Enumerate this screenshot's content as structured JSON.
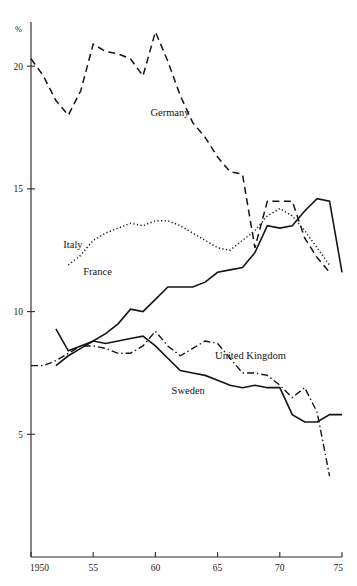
{
  "chart_data": {
    "type": "line",
    "title": "",
    "xlabel": "",
    "ylabel": "%",
    "xlim": [
      1950,
      1975
    ],
    "ylim": [
      0,
      21.8
    ],
    "grid": false,
    "legend_position": "inline-labels",
    "x_ticks": [
      {
        "value": 1950,
        "label": "1950"
      },
      {
        "value": 1955,
        "label": "55"
      },
      {
        "value": 1960,
        "label": "60"
      },
      {
        "value": 1965,
        "label": "65"
      },
      {
        "value": 1970,
        "label": "70"
      },
      {
        "value": 1975,
        "label": "75"
      }
    ],
    "y_ticks": [
      {
        "value": 5,
        "label": "5"
      },
      {
        "value": 10,
        "label": "10"
      },
      {
        "value": 15,
        "label": "15"
      },
      {
        "value": 20,
        "label": "20"
      }
    ],
    "series": [
      {
        "name": "Germany",
        "label": "Germany",
        "style": "dashed",
        "dash": "7,4.5",
        "width": 1.5,
        "label_x": 1959.6,
        "label_y": 17.95,
        "x": [
          1950,
          1951,
          1952,
          1953,
          1954,
          1955,
          1956,
          1957,
          1958,
          1959,
          1960,
          1961,
          1962,
          1963,
          1964,
          1965,
          1966,
          1967,
          1968,
          1969,
          1970,
          1971,
          1972,
          1973,
          1974
        ],
        "values": [
          20.3,
          19.6,
          18.6,
          18.0,
          19.0,
          20.9,
          20.6,
          20.5,
          20.3,
          19.6,
          21.4,
          20.2,
          18.8,
          17.7,
          17.1,
          16.3,
          15.7,
          15.6,
          12.6,
          14.5,
          14.5,
          14.5,
          13.0,
          12.2,
          11.6
        ]
      },
      {
        "name": "Italy",
        "label": "Italy",
        "style": "dotted",
        "dash": "1.2,2.4",
        "width": 1.5,
        "label_x": 1952.6,
        "label_y": 12.6,
        "x": [
          1953,
          1954,
          1955,
          1956,
          1957,
          1958,
          1959,
          1960,
          1961,
          1962,
          1963,
          1964,
          1965,
          1966,
          1967,
          1968,
          1969,
          1970,
          1971,
          1972,
          1973,
          1974
        ],
        "values": [
          11.9,
          12.3,
          12.9,
          13.2,
          13.4,
          13.6,
          13.5,
          13.7,
          13.7,
          13.5,
          13.2,
          12.9,
          12.6,
          12.5,
          12.9,
          13.3,
          13.9,
          14.2,
          13.9,
          13.3,
          12.6,
          11.9
        ]
      },
      {
        "name": "France",
        "label": "France",
        "style": "solid",
        "dash": "",
        "width": 1.6,
        "label_x": 1954.2,
        "label_y": 11.5,
        "x": [
          1952,
          1953,
          1954,
          1955,
          1956,
          1957,
          1958,
          1959,
          1960,
          1961,
          1962,
          1963,
          1964,
          1965,
          1966,
          1967,
          1968,
          1969,
          1970,
          1971,
          1972,
          1973,
          1974,
          1975
        ],
        "values": [
          7.8,
          8.2,
          8.5,
          8.8,
          9.1,
          9.5,
          10.1,
          10.0,
          10.5,
          11.0,
          11.0,
          11.0,
          11.2,
          11.6,
          11.7,
          11.8,
          12.4,
          13.5,
          13.4,
          13.5,
          14.1,
          14.6,
          14.5,
          11.6
        ]
      },
      {
        "name": "United Kingdom",
        "label": "United Kingdom",
        "style": "dash-dot",
        "dash": "7,3,1.4,3",
        "width": 1.4,
        "label_x": 1964.8,
        "label_y": 8.05,
        "x": [
          1950,
          1951,
          1952,
          1953,
          1954,
          1955,
          1956,
          1957,
          1958,
          1959,
          1960,
          1961,
          1962,
          1963,
          1964,
          1965,
          1966,
          1967,
          1968,
          1969,
          1970,
          1971,
          1972,
          1973,
          1974
        ],
        "values": [
          7.8,
          7.8,
          8.0,
          8.3,
          8.6,
          8.6,
          8.5,
          8.3,
          8.3,
          8.6,
          9.2,
          8.6,
          8.2,
          8.5,
          8.8,
          8.7,
          8.1,
          7.5,
          7.5,
          7.4,
          7.0,
          6.5,
          6.9,
          5.9,
          3.3
        ]
      },
      {
        "name": "Sweden",
        "label": "Sweden",
        "style": "solid",
        "dash": "",
        "width": 1.6,
        "label_x": 1961.3,
        "label_y": 6.65,
        "x": [
          1952,
          1953,
          1954,
          1955,
          1956,
          1957,
          1958,
          1959,
          1960,
          1961,
          1962,
          1963,
          1964,
          1965,
          1966,
          1967,
          1968,
          1969,
          1970,
          1971,
          1972,
          1973,
          1974,
          1975
        ],
        "values": [
          9.3,
          8.4,
          8.6,
          8.8,
          8.7,
          8.8,
          8.9,
          9.0,
          8.6,
          8.1,
          7.6,
          7.5,
          7.4,
          7.2,
          7.0,
          6.9,
          7.0,
          6.9,
          6.9,
          5.8,
          5.5,
          5.5,
          5.8,
          5.8
        ]
      }
    ]
  },
  "plot": {
    "margin_left": 31,
    "margin_right": 342,
    "margin_top": 22,
    "margin_bottom": 557,
    "y_unit_label": "%"
  }
}
